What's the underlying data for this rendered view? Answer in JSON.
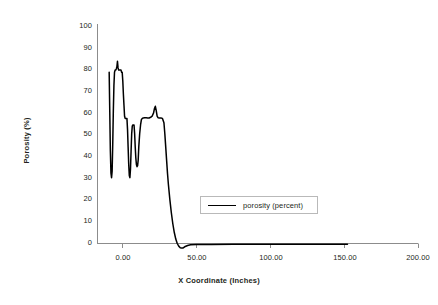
{
  "chart_data": {
    "type": "line",
    "title": "",
    "xlabel": "X Coordinate (Inches)",
    "ylabel": "Porosity (%)",
    "xlim": [
      -17,
      217
    ],
    "ylim": [
      -5,
      100
    ],
    "grid": false,
    "legend_position": "inside-center-right",
    "x_ticks": [
      0,
      50,
      100,
      150,
      200
    ],
    "x_tick_labels": [
      "0.00",
      "50.00",
      "100.00",
      "150.00",
      "200.00"
    ],
    "y_ticks": [
      0,
      10,
      20,
      30,
      40,
      50,
      60,
      70,
      80,
      90,
      100
    ],
    "y_tick_labels": [
      "0",
      "10",
      "20",
      "30",
      "40",
      "50",
      "60",
      "70",
      "80",
      "90",
      "100"
    ],
    "series": [
      {
        "name": "porosity (percent)",
        "color": "#000000",
        "x": [
          -9.0,
          -8.6,
          -8.2,
          -7.8,
          -7.4,
          -7.0,
          -6.6,
          -6.2,
          -5.8,
          -5.4,
          -5.0,
          -4.6,
          -4.2,
          -3.8,
          -3.4,
          -3.0,
          -2.6,
          -2.2,
          -1.8,
          -1.4,
          -1.0,
          -0.6,
          -0.2,
          0.2,
          0.6,
          1.0,
          1.4,
          1.8,
          2.2,
          2.6,
          3.0,
          3.4,
          3.8,
          4.2,
          4.6,
          5.0,
          5.4,
          5.8,
          6.2,
          6.6,
          7.0,
          7.4,
          7.8,
          8.2,
          8.6,
          9.0,
          9.4,
          9.8,
          10.2,
          10.6,
          11.0,
          11.6,
          12.2,
          12.8,
          13.4,
          14.0,
          15.0,
          16.0,
          17.0,
          18.0,
          19.0,
          20.0,
          21.0,
          21.6,
          22.2,
          22.8,
          23.4,
          24.0,
          25.0,
          26.0,
          27.0,
          28.0,
          28.6,
          29.2,
          29.8,
          30.4,
          31.0,
          32.0,
          33.0,
          34.0,
          35.0,
          36.0,
          37.0,
          38.0,
          39.0,
          40.0,
          41.0,
          42.0,
          44.0,
          46.0,
          50.0,
          60.0,
          75.0,
          90.0,
          105.0,
          120.0,
          135.0,
          145.0,
          152.0
        ],
        "y": [
          78.0,
          60.0,
          42.0,
          32.0,
          30.0,
          33.0,
          45.0,
          60.0,
          72.0,
          78.0,
          79.0,
          79.0,
          79.5,
          80.5,
          83.0,
          80.0,
          79.0,
          79.0,
          79.0,
          79.0,
          79.0,
          78.0,
          78.0,
          74.0,
          68.0,
          63.0,
          58.0,
          57.0,
          57.0,
          57.0,
          57.0,
          52.0,
          44.0,
          36.0,
          31.0,
          30.0,
          34.0,
          42.0,
          50.0,
          53.5,
          54.0,
          54.0,
          54.0,
          50.0,
          44.0,
          39.0,
          36.0,
          35.0,
          35.5,
          38.0,
          44.0,
          50.0,
          54.0,
          56.5,
          57.0,
          57.2,
          57.3,
          57.3,
          57.2,
          57.2,
          57.5,
          58.0,
          59.5,
          61.5,
          62.5,
          60.5,
          58.0,
          57.3,
          57.2,
          57.2,
          57.0,
          55.0,
          50.0,
          44.0,
          38.0,
          32.0,
          27.0,
          20.0,
          14.0,
          9.0,
          5.0,
          2.0,
          0.0,
          -1.2,
          -1.9,
          -2.1,
          -2.0,
          -1.5,
          -0.9,
          -0.6,
          -0.5,
          -0.4,
          -0.35,
          -0.3,
          -0.3,
          -0.3,
          -0.3,
          -0.3,
          -0.3
        ]
      }
    ]
  },
  "legend": {
    "entries": [
      {
        "label": "porosity (percent)"
      }
    ]
  },
  "axes": {
    "x_title": "X Coordinate (Inches)",
    "y_title": "Porosity (%)"
  }
}
